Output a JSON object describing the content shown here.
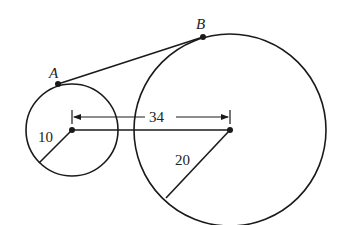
{
  "diagram": {
    "type": "two circles with external tangent",
    "points": {
      "A": {
        "label": "A"
      },
      "B": {
        "label": "B"
      }
    },
    "small_circle": {
      "radius_label": "10"
    },
    "large_circle": {
      "radius_label": "20"
    },
    "center_distance_label": "34",
    "colors": {
      "stroke": "#1a1a1a",
      "background": "#ffffff"
    }
  }
}
